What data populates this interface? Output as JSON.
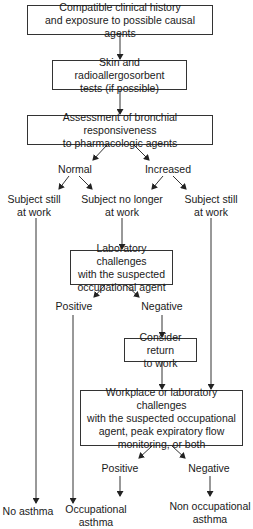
{
  "diagram": {
    "type": "flowchart",
    "nodes": {
      "history": "Compatible clinical history\nand exposure to possible causal agents",
      "skin_tests": "Skin and radioallergosorbent\ntests (if possible)",
      "bronchial": "Assessment of bronchial responsiveness\nto pharmacologic agents",
      "normal": "Normal",
      "increased": "Increased",
      "still_work_left": "Subject still\nat work",
      "no_longer_work": "Subject no longer\nat work",
      "still_work_right": "Subject still\nat work",
      "lab_challenges": "Laboratory challenges\nwith the suspected\noccupational agent",
      "lab_positive": "Positive",
      "lab_negative": "Negative",
      "consider_return": "Consider return\nto work",
      "workplace_challenges": "Workplace or laboratory challenges\nwith the suspected occupational\nagent, peak expiratory flow\nmonitoring, or both",
      "wp_positive": "Positive",
      "wp_negative": "Negative",
      "no_asthma": "No asthma",
      "occupational_asthma": "Occupational\nasthma",
      "non_occupational_asthma": "Non occupational\nasthma"
    },
    "edges": [
      [
        "history",
        "skin_tests"
      ],
      [
        "skin_tests",
        "bronchial"
      ],
      [
        "bronchial",
        "normal"
      ],
      [
        "bronchial",
        "increased"
      ],
      [
        "normal",
        "still_work_left"
      ],
      [
        "normal",
        "no_longer_work"
      ],
      [
        "increased",
        "no_longer_work"
      ],
      [
        "increased",
        "still_work_right"
      ],
      [
        "no_longer_work",
        "lab_challenges"
      ],
      [
        "lab_challenges",
        "lab_positive"
      ],
      [
        "lab_challenges",
        "lab_negative"
      ],
      [
        "lab_negative",
        "consider_return"
      ],
      [
        "consider_return",
        "workplace_challenges"
      ],
      [
        "still_work_right",
        "workplace_challenges"
      ],
      [
        "workplace_challenges",
        "wp_positive"
      ],
      [
        "workplace_challenges",
        "wp_negative"
      ],
      [
        "still_work_left",
        "no_asthma"
      ],
      [
        "lab_positive",
        "occupational_asthma"
      ],
      [
        "wp_positive",
        "occupational_asthma"
      ],
      [
        "wp_negative",
        "non_occupational_asthma"
      ]
    ]
  },
  "text": {
    "history_l1": "Compatible clinical history",
    "history_l2": "and exposure to possible causal agents",
    "skin_l1": "Skin and radioallergosorbent",
    "skin_l2": "tests (if possible)",
    "bron_l1": "Assessment of bronchial responsiveness",
    "bron_l2": "to pharmacologic agents",
    "normal": "Normal",
    "increased": "Increased",
    "still_left_l1": "Subject still",
    "still_left_l2": "at work",
    "nolonger_l1": "Subject no longer",
    "nolonger_l2": "at work",
    "still_right_l1": "Subject still",
    "still_right_l2": "at work",
    "lab_l1": "Laboratory challenges",
    "lab_l2": "with the suspected",
    "lab_l3": "occupational agent",
    "lab_positive": "Positive",
    "lab_negative": "Negative",
    "consider_l1": "Consider return",
    "consider_l2": "to work",
    "wp_l1": "Workplace or laboratory challenges",
    "wp_l2": "with the suspected occupational",
    "wp_l3": "agent, peak expiratory flow",
    "wp_l4": "monitoring, or both",
    "wp_positive": "Positive",
    "wp_negative": "Negative",
    "no_asthma": "No asthma",
    "occ_l1": "Occupational",
    "occ_l2": "asthma",
    "nonocc_l1": "Non occupational",
    "nonocc_l2": "asthma"
  }
}
